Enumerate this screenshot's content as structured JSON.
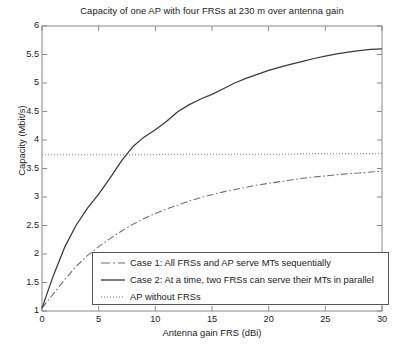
{
  "chart_data": {
    "type": "line",
    "title": "Capacity of one AP with four FRSs at 230 m over antenna gain",
    "xlabel": "Antenna gain FRS (dBi)",
    "ylabel": "Capacity (Mbit/s)",
    "xlim": [
      0,
      30
    ],
    "ylim": [
      1,
      6
    ],
    "xticks": [
      0,
      5,
      10,
      15,
      20,
      25,
      30
    ],
    "yticks": [
      1,
      1.5,
      2,
      2.5,
      3,
      3.5,
      4,
      4.5,
      5,
      5.5,
      6
    ],
    "xtick_labels": [
      "0",
      "5",
      "10",
      "15",
      "20",
      "25",
      "30"
    ],
    "ytick_labels": [
      "1",
      "1.5",
      "2",
      "2.5",
      "3",
      "3.5",
      "4",
      "4.5",
      "5",
      "5.5",
      "6"
    ],
    "grid": false,
    "legend_position": "lower center",
    "x": [
      0,
      1,
      2,
      3,
      4,
      5,
      6,
      7,
      8,
      9,
      10,
      11,
      12,
      13,
      14,
      15,
      16,
      17,
      18,
      19,
      20,
      21,
      22,
      23,
      24,
      25,
      26,
      27,
      28,
      29,
      30
    ],
    "series": [
      {
        "name": "Case 1: All FRSs and AP serve MTs sequentially",
        "style": "dash-dot",
        "color": "#6d6d6d",
        "values": [
          1.05,
          1.3,
          1.55,
          1.78,
          1.97,
          2.13,
          2.27,
          2.4,
          2.52,
          2.62,
          2.71,
          2.79,
          2.86,
          2.93,
          2.99,
          3.04,
          3.09,
          3.13,
          3.17,
          3.21,
          3.24,
          3.27,
          3.3,
          3.33,
          3.35,
          3.37,
          3.39,
          3.41,
          3.42,
          3.44,
          3.45
        ]
      },
      {
        "name": "Case 2: At a time, two FRSs can serve their MTs in parallel",
        "style": "solid",
        "color": "#3a3a3a",
        "values": [
          1.05,
          1.62,
          2.12,
          2.5,
          2.8,
          3.05,
          3.33,
          3.63,
          3.88,
          4.05,
          4.18,
          4.33,
          4.5,
          4.62,
          4.72,
          4.8,
          4.9,
          5.0,
          5.08,
          5.15,
          5.22,
          5.28,
          5.33,
          5.38,
          5.43,
          5.47,
          5.51,
          5.54,
          5.57,
          5.59,
          5.6
        ]
      },
      {
        "name": "AP without FRSs",
        "style": "dotted",
        "color": "#777777",
        "values": [
          3.74,
          3.74,
          3.74,
          3.74,
          3.74,
          3.74,
          3.74,
          3.74,
          3.74,
          3.74,
          3.74,
          3.75,
          3.75,
          3.75,
          3.75,
          3.75,
          3.75,
          3.75,
          3.75,
          3.75,
          3.75,
          3.75,
          3.75,
          3.76,
          3.76,
          3.76,
          3.76,
          3.76,
          3.76,
          3.76,
          3.76
        ]
      }
    ]
  },
  "legend": {
    "items": [
      {
        "label": "Case 1: All FRSs and AP serve MTs sequentially"
      },
      {
        "label": "Case 2: At a time, two FRSs can serve their MTs in parallel"
      },
      {
        "label": "AP without FRSs"
      }
    ]
  }
}
